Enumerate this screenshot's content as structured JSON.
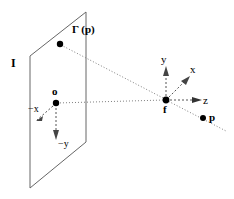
{
  "figure": {
    "stroke_color": "#000000",
    "plane_edge_color": "#555555",
    "dotted_color": "#777777",
    "background": "#ffffff"
  },
  "labels": {
    "image_plane": "I",
    "projected_point": "Γ (p)",
    "plane_origin": "o",
    "focal_point": "f",
    "scene_point": "p",
    "axis_neg_x": "−x",
    "axis_neg_y": "−y",
    "axis_x": "x",
    "axis_y": "y",
    "axis_z": "z"
  },
  "geometry": {
    "plane_corners": "30,56 86,12 86,142 30,188",
    "point_gamma_p": [
      60,
      44
    ],
    "point_o": [
      56,
      103
    ],
    "point_f": [
      166,
      100
    ],
    "point_p": [
      203,
      118
    ]
  }
}
